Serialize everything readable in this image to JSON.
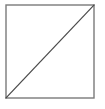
{
  "figure": {
    "kind": "geometric-figure",
    "canvas": {
      "width": 105,
      "height": 109,
      "background_color": "#ffffff"
    },
    "square": {
      "name": "square-outline",
      "x": 6,
      "y": 5,
      "width": 88,
      "height": 93,
      "stroke_color": "#7a7a7a",
      "stroke_width": 1.4,
      "fill_color": "#ffffff"
    },
    "diagonal": {
      "name": "diagonal-line",
      "orientation": "bottom-left-to-top-right",
      "x1": 6,
      "y1": 98,
      "x2": 94,
      "y2": 5,
      "stroke_color": "#4a4a4a",
      "stroke_width": 1.2
    },
    "labels": [],
    "text": []
  }
}
